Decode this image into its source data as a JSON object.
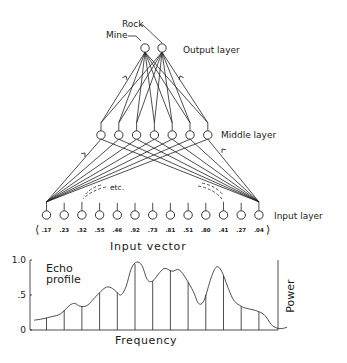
{
  "network": {
    "output_layer": {
      "label": "Output layer",
      "nodes": [
        "Mine",
        "Rock"
      ]
    },
    "middle_layer": {
      "label": "Middle layer",
      "node_count": 7
    },
    "input_layer": {
      "label": "Input layer",
      "node_count": 13,
      "etc_label": "etc."
    },
    "input_vector": {
      "label": "Input vector",
      "open_bracket": "⟨",
      "close_bracket": "⟩",
      "values": [
        ".17",
        ".23",
        ".32",
        ".55",
        ".46",
        ".92",
        ".73",
        ".81",
        ".51",
        ".80",
        ".41",
        ".27",
        ".04"
      ]
    }
  },
  "chart_data": {
    "type": "line",
    "title": "Echo profile",
    "xlabel": "Frequency",
    "ylabel": "Power",
    "ylim": [
      0,
      1.0
    ],
    "y_ticks": [
      "0",
      ".5",
      "1.0"
    ],
    "y_tick_values": [
      0,
      0.5,
      1.0
    ],
    "sample_values": [
      0.17,
      0.23,
      0.32,
      0.55,
      0.46,
      0.92,
      0.73,
      0.81,
      0.51,
      0.8,
      0.41,
      0.27,
      0.04
    ],
    "curve": [
      [
        0.0,
        0.14
      ],
      [
        0.5,
        0.16
      ],
      [
        1.0,
        0.19
      ],
      [
        1.5,
        0.23
      ],
      [
        2.0,
        0.35
      ],
      [
        2.3,
        0.38
      ],
      [
        2.6,
        0.34
      ],
      [
        3.0,
        0.35
      ],
      [
        3.5,
        0.48
      ],
      [
        4.0,
        0.6
      ],
      [
        4.3,
        0.61
      ],
      [
        4.6,
        0.56
      ],
      [
        4.9,
        0.5
      ],
      [
        5.2,
        0.62
      ],
      [
        5.5,
        0.88
      ],
      [
        5.8,
        0.97
      ],
      [
        6.1,
        0.92
      ],
      [
        6.4,
        0.72
      ],
      [
        6.7,
        0.7
      ],
      [
        7.1,
        0.82
      ],
      [
        7.4,
        0.88
      ],
      [
        7.8,
        0.84
      ],
      [
        8.2,
        0.86
      ],
      [
        8.6,
        0.73
      ],
      [
        9.0,
        0.55
      ],
      [
        9.3,
        0.38
      ],
      [
        9.6,
        0.42
      ],
      [
        10.0,
        0.74
      ],
      [
        10.3,
        0.9
      ],
      [
        10.6,
        0.84
      ],
      [
        11.0,
        0.58
      ],
      [
        11.3,
        0.42
      ],
      [
        11.7,
        0.34
      ],
      [
        12.0,
        0.31
      ],
      [
        12.5,
        0.28
      ],
      [
        13.0,
        0.22
      ],
      [
        13.4,
        0.08
      ],
      [
        13.7,
        0.03
      ],
      [
        14.0,
        0.02
      ],
      [
        14.3,
        0.04
      ]
    ]
  }
}
